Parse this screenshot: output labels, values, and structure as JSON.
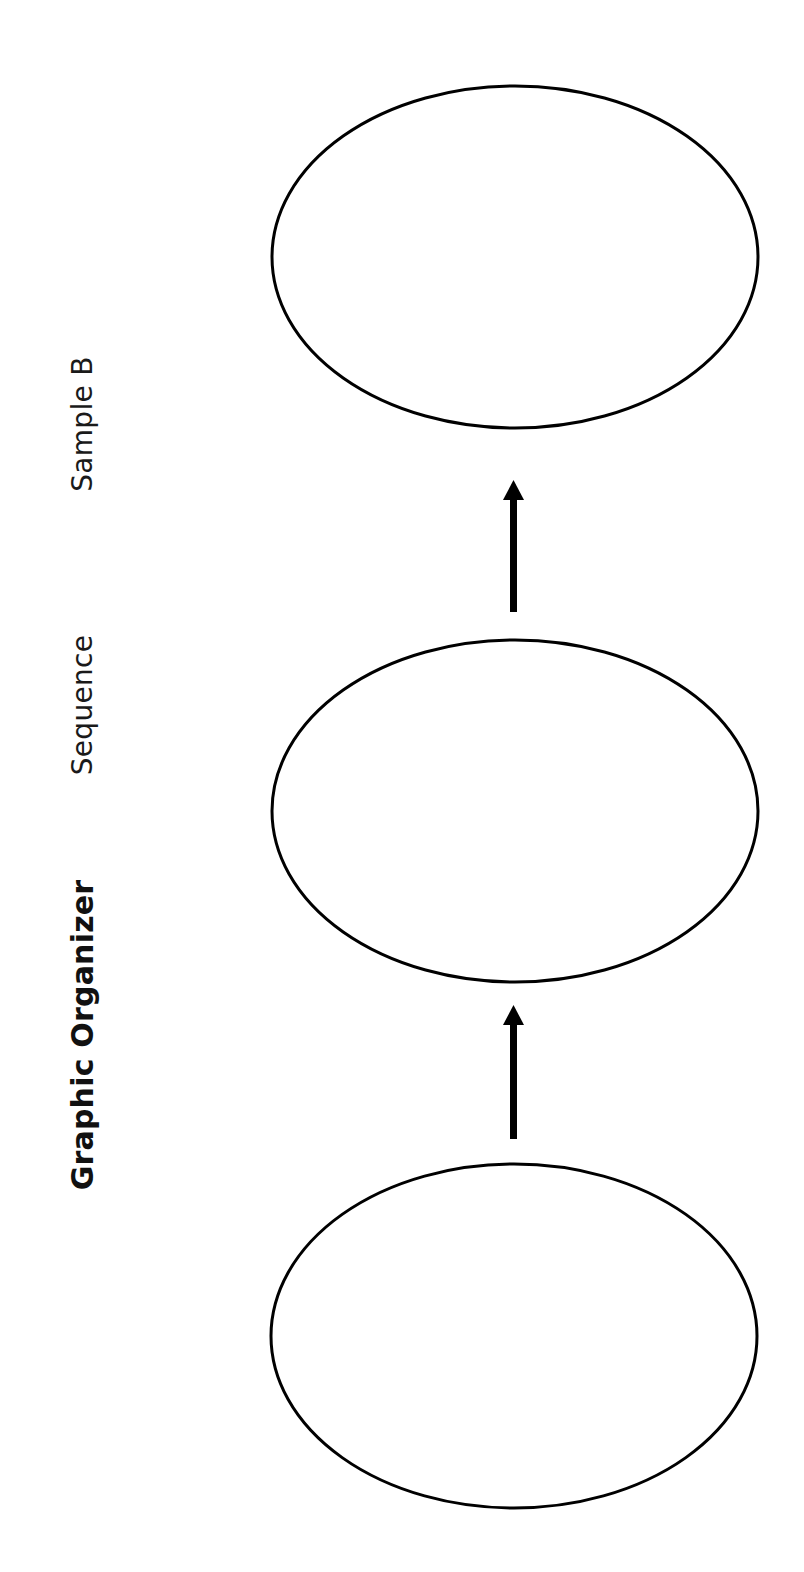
{
  "header": {
    "title": "Graphic Organizer",
    "subtitle": "Sequence",
    "sample": "Sample B"
  },
  "diagram": {
    "type": "sequence",
    "orientation": "rotated-90",
    "stroke_color": "#000000",
    "background": "#ffffff",
    "nodes": [
      {
        "id": "step-1",
        "label": "",
        "cx": 514,
        "cy": 1336,
        "rx": 243,
        "ry": 172
      },
      {
        "id": "step-2",
        "label": "",
        "cx": 515,
        "cy": 811,
        "rx": 243,
        "ry": 171
      },
      {
        "id": "step-3",
        "label": "",
        "cx": 515,
        "cy": 257,
        "rx": 243,
        "ry": 171
      }
    ],
    "arrows": [
      {
        "from": "step-1",
        "to": "step-2",
        "x": 513,
        "y_start": 1139,
        "y_end": 1005
      },
      {
        "from": "step-2",
        "to": "step-3",
        "x": 513,
        "y_start": 612,
        "y_end": 480
      }
    ]
  }
}
